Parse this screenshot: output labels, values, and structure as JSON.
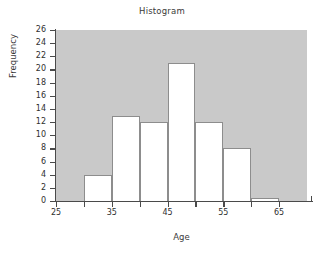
{
  "chart_data": {
    "type": "bar",
    "title": "Histogram",
    "xlabel": "Age",
    "ylabel": "Frequency",
    "xlim": [
      25,
      70
    ],
    "ylim": [
      0,
      26
    ],
    "grid": false,
    "legend": false,
    "bin_width": 5,
    "bin_edges": [
      30,
      35,
      40,
      45,
      50,
      55,
      60,
      65
    ],
    "categories": [
      "30-35",
      "35-40",
      "40-45",
      "45-50",
      "50-55",
      "55-60",
      "60-65"
    ],
    "values": [
      4,
      13,
      12,
      21,
      12,
      8,
      0.5
    ],
    "bars": [
      {
        "x0": 30,
        "x1": 35,
        "value": 4
      },
      {
        "x0": 35,
        "x1": 40,
        "value": 13
      },
      {
        "x0": 40,
        "x1": 45,
        "value": 12
      },
      {
        "x0": 45,
        "x1": 50,
        "value": 21
      },
      {
        "x0": 50,
        "x1": 55,
        "value": 12
      },
      {
        "x0": 55,
        "x1": 60,
        "value": 8
      },
      {
        "x0": 60,
        "x1": 65,
        "value": 0.5
      }
    ],
    "y_ticks": [
      0,
      2,
      4,
      6,
      8,
      10,
      12,
      14,
      16,
      18,
      20,
      22,
      24,
      26
    ],
    "y_tick_labels": [
      "0",
      "2",
      "4",
      "6",
      "8",
      "10",
      "12",
      "14",
      "16",
      "18",
      "20",
      "22",
      "24",
      "26"
    ],
    "x_ticks": [
      25,
      30,
      35,
      40,
      45,
      50,
      55,
      60,
      65
    ],
    "x_tick_labels": [
      "25",
      "",
      "35",
      "",
      "45",
      "",
      "55",
      "",
      "65"
    ],
    "colors": {
      "plot_background": "#c9c9c9",
      "bar_fill": "#ffffff",
      "bar_edge": "#8d8d8d",
      "axis": "#4a4a4a",
      "text": "#2f2f2f",
      "page_background": "#ffffff"
    }
  }
}
